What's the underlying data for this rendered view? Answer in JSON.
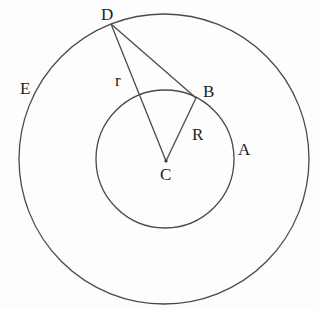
{
  "diagram": {
    "type": "geometry",
    "colors": {
      "line": "#4a4a4a",
      "text": "#222222",
      "background": "#fdfdfd"
    },
    "center": {
      "name": "C",
      "x": 165,
      "y": 160
    },
    "circles": [
      {
        "name": "inner",
        "cx": 165,
        "cy": 160,
        "r": 69,
        "label": "A"
      },
      {
        "name": "outer",
        "cx": 165,
        "cy": 160,
        "r": 145,
        "label": "E"
      }
    ],
    "points": {
      "D": {
        "x": 111,
        "y": 24
      },
      "B": {
        "x": 196,
        "y": 98
      },
      "C": {
        "x": 166,
        "y": 161
      }
    },
    "segments": [
      {
        "from": "D",
        "to": "C",
        "label": "r"
      },
      {
        "from": "D",
        "to": "B",
        "label": ""
      },
      {
        "from": "B",
        "to": "C",
        "label": "R"
      }
    ],
    "labels": {
      "D": "D",
      "B": "B",
      "C": "C",
      "A": "A",
      "E": "E",
      "r": "r",
      "R": "R"
    }
  }
}
